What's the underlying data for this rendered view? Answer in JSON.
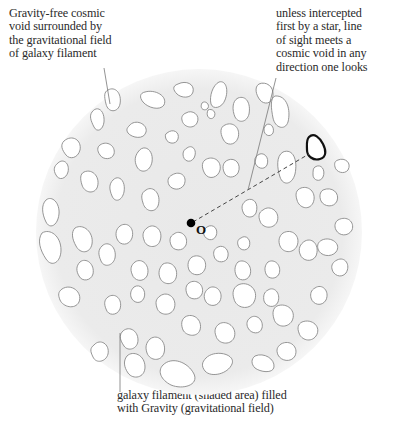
{
  "labels": {
    "void": {
      "lines": [
        "Gravity-free cosmic",
        "void surrounded by",
        "the gravitational field",
        "of galaxy filament"
      ]
    },
    "sight": {
      "lines": [
        "unless intercepted",
        "first by a star, line",
        "of sight meets a",
        "cosmic void in any",
        "direction one looks"
      ]
    },
    "filament": {
      "lines": [
        "galaxy filament (shaded area) filled",
        "with Gravity (gravitational field)"
      ]
    },
    "origin": "O"
  },
  "colors": {
    "filament_fill": "#ebebeb",
    "void_fill": "#ffffff",
    "void_stroke": "#8a8a8a",
    "highlight_stroke": "#111111",
    "leader_line": "#777777",
    "origin_dot": "#000000"
  },
  "geometry": {
    "circle": {
      "cx": 199,
      "cy": 232,
      "r": 163
    },
    "origin": {
      "x": 192,
      "y": 223
    },
    "highlighted_void": {
      "x": 316,
      "y": 148
    }
  }
}
